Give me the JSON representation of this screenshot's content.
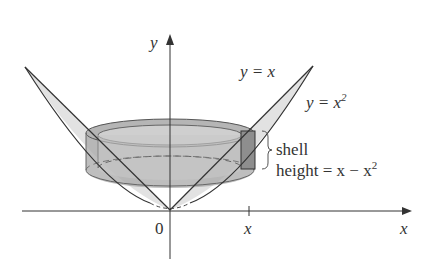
{
  "figure": {
    "type": "diagram"
  },
  "labels": {
    "y_axis": "y",
    "x_axis": "x",
    "origin": "0",
    "x_tick": "x",
    "curve_line": "y = x",
    "curve_parabola_base": "y = x",
    "curve_parabola_exp": "2",
    "shell_label": "shell",
    "height_label_prefix": "height = x − x",
    "height_label_exp": "2"
  },
  "colors": {
    "region_fill": "#dcdcdc",
    "shell_fill": "#9a9a9a",
    "shell_light": "#c4c4c4",
    "stroke": "#333333"
  }
}
